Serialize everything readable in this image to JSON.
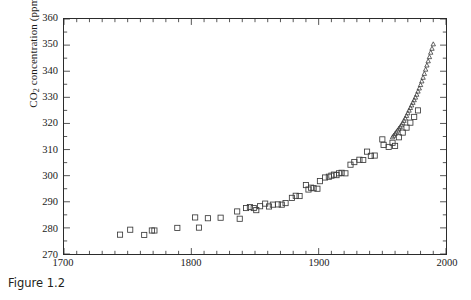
{
  "caption": "Figure 1.2",
  "chart_data": {
    "type": "scatter",
    "title": "",
    "xlabel": "",
    "ylabel": "CO2 concentration (ppmv)",
    "ylabel_parts": {
      "prefix": "CO",
      "sub": "2",
      "suffix": " concentration (ppmv)"
    },
    "xlim": [
      1700,
      2000
    ],
    "ylim": [
      270,
      360
    ],
    "x_major_ticks": [
      1700,
      1800,
      1900,
      2000
    ],
    "x_tick_labels": [
      "1700",
      "1800",
      "1900",
      "2000"
    ],
    "x_minor_tick_step": 10,
    "y_major_ticks": [
      270,
      280,
      290,
      300,
      310,
      320,
      330,
      340,
      350,
      360
    ],
    "y_tick_labels": [
      "270",
      "280",
      "290",
      "300",
      "310",
      "320",
      "330",
      "340",
      "350",
      "360"
    ],
    "y_minor_tick_step": 5,
    "grid": false,
    "legend": false,
    "axis_color": "#2b2b2b",
    "marker_color": "#3a3a3a",
    "series": [
      {
        "name": "Ice-core record",
        "marker": "open-square",
        "marker_size": 5.2,
        "points": [
          [
            1744,
            277.4
          ],
          [
            1752,
            279.3
          ],
          [
            1763,
            277.3
          ],
          [
            1769,
            279.0
          ],
          [
            1771,
            279.0
          ],
          [
            1789,
            280.0
          ],
          [
            1803,
            284.0
          ],
          [
            1806,
            280.1
          ],
          [
            1813,
            283.7
          ],
          [
            1823,
            283.9
          ],
          [
            1836,
            286.3
          ],
          [
            1838,
            283.5
          ],
          [
            1843,
            287.6
          ],
          [
            1846,
            288.0
          ],
          [
            1849,
            287.6
          ],
          [
            1851,
            286.8
          ],
          [
            1854,
            288.3
          ],
          [
            1858,
            289.3
          ],
          [
            1861,
            288.2
          ],
          [
            1864,
            288.9
          ],
          [
            1868,
            289.0
          ],
          [
            1871,
            288.9
          ],
          [
            1874,
            289.5
          ],
          [
            1879,
            291.5
          ],
          [
            1882,
            292.3
          ],
          [
            1885,
            292.2
          ],
          [
            1890,
            296.4
          ],
          [
            1892,
            294.7
          ],
          [
            1894,
            295.4
          ],
          [
            1896,
            295.2
          ],
          [
            1899,
            295.0
          ],
          [
            1901,
            297.9
          ],
          [
            1905,
            299.3
          ],
          [
            1908,
            299.6
          ],
          [
            1910,
            300.0
          ],
          [
            1912,
            300.4
          ],
          [
            1914,
            300.2
          ],
          [
            1916,
            300.9
          ],
          [
            1918,
            301.1
          ],
          [
            1921,
            300.9
          ],
          [
            1925,
            304.2
          ],
          [
            1928,
            305.2
          ],
          [
            1932,
            306.1
          ],
          [
            1935,
            306.0
          ],
          [
            1938,
            309.2
          ],
          [
            1941,
            307.6
          ],
          [
            1944,
            307.7
          ],
          [
            1950,
            313.9
          ],
          [
            1951,
            311.8
          ],
          [
            1955,
            311.0
          ],
          [
            1958,
            312.6
          ],
          [
            1960,
            311.4
          ],
          [
            1963,
            314.7
          ],
          [
            1966,
            316.5
          ],
          [
            1969,
            318.4
          ],
          [
            1972,
            320.3
          ],
          [
            1975,
            322.5
          ],
          [
            1978,
            325.0
          ]
        ]
      },
      {
        "name": "Mauna Loa record",
        "marker": "open-triangle",
        "marker_size": 4.4,
        "points": [
          [
            1958,
            314.7
          ],
          [
            1959,
            315.3
          ],
          [
            1960,
            316.0
          ],
          [
            1961,
            316.6
          ],
          [
            1962,
            317.3
          ],
          [
            1963,
            318.0
          ],
          [
            1964,
            318.6
          ],
          [
            1965,
            319.3
          ],
          [
            1966,
            320.1
          ],
          [
            1967,
            321.0
          ],
          [
            1968,
            321.9
          ],
          [
            1969,
            322.9
          ],
          [
            1970,
            323.9
          ],
          [
            1971,
            324.9
          ],
          [
            1972,
            325.9
          ],
          [
            1973,
            326.9
          ],
          [
            1974,
            327.9
          ],
          [
            1975,
            328.9
          ],
          [
            1976,
            329.9
          ],
          [
            1977,
            331.0
          ],
          [
            1978,
            332.2
          ],
          [
            1979,
            333.4
          ],
          [
            1980,
            334.7
          ],
          [
            1981,
            336.1
          ],
          [
            1982,
            337.5
          ],
          [
            1983,
            339.0
          ],
          [
            1984,
            340.6
          ],
          [
            1985,
            342.2
          ],
          [
            1986,
            343.8
          ],
          [
            1987,
            345.4
          ],
          [
            1988,
            347.1
          ],
          [
            1989,
            348.6
          ],
          [
            1990,
            350.3
          ]
        ]
      }
    ]
  }
}
